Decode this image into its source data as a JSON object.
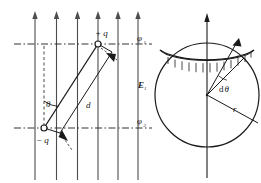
{
  "figure": {
    "panels": [
      {
        "id": "left-panel",
        "name": "dipole-in-uniform-field",
        "description": "Uniform upward electric field with a dipole of charges +q and -q separated by distance d at angle theta to the field"
      },
      {
        "id": "right-panel",
        "name": "sphere-zone-element",
        "description": "Sphere with polar axis, a hatched annular zone band, radius r and angular element d-theta at the centre"
      }
    ]
  },
  "left_panel": {
    "field_lines": {
      "name": "uniform-field-lines",
      "count": 6,
      "direction": "up",
      "x_positions": [
        35,
        56.5,
        77.5,
        98,
        118,
        138
      ],
      "y_top": 12,
      "y_bottom": 180,
      "color": "#4d4d4d"
    },
    "field_label": "E",
    "field_label_subscript": "1",
    "equipotential_top_label": "φ",
    "equipotential_top_subscript": "1",
    "equipotential_bottom_label": "φ",
    "equipotential_bottom_subscript": "2",
    "positive_charge_label": "+ q",
    "negative_charge_label": "− q",
    "angle_label": "θ",
    "separation_label": "d",
    "equipotential_y_top": 44,
    "equipotential_y_bottom": 128,
    "charge_positive_point": [
      98,
      44
    ],
    "charge_negative_point": [
      44,
      128
    ],
    "dash_color": "#333333"
  },
  "right_panel": {
    "sphere": {
      "name": "sphere-outline",
      "centre": [
        207,
        95
      ],
      "radius": 52
    },
    "axis": {
      "name": "polar-axis",
      "x": 207,
      "y_top": 14,
      "y_bottom": 178,
      "direction": "up"
    },
    "zone_band": {
      "name": "hatched-zone-band",
      "hatch_count": 13,
      "upper_arc_y": 50,
      "lower_arc_y": 64
    },
    "radius_label": "r",
    "angle_element_label": "dθ",
    "angle_element_prefix": "d",
    "angle_element_symbol": "θ"
  },
  "colors": {
    "ink": "#1a1a1a",
    "line": "#3a3a3a",
    "field": "#4d4d4d",
    "dash": "#333333",
    "background": "#ffffff"
  }
}
